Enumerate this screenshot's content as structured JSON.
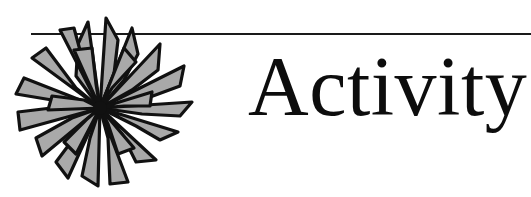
{
  "page": {
    "background_color": "#ffffff",
    "width": 531,
    "height": 197
  },
  "header": {
    "title": "Activity",
    "title_color": "#0d0d0d"
  },
  "rule": {
    "color": "#1a1a1a",
    "thickness_px": 2
  },
  "ornament": {
    "name": "starburst-flower",
    "petal_fill_color": "#a9a9a9",
    "petal_outline_color": "#111111",
    "petal_count": 22,
    "center_color": "#111111"
  }
}
